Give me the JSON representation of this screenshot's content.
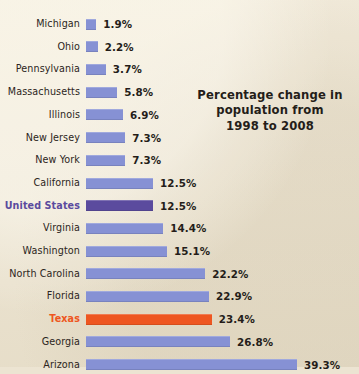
{
  "figure": {
    "background_color": "#ece4d2",
    "text_color": "#241d19",
    "title_lines": [
      "Percentage change in",
      "population from",
      "1998 to 2008"
    ]
  },
  "colors": {
    "bar_default": "#8691d4",
    "bar_united_states": "#5b4b9e",
    "bar_texas": "#ee5620",
    "label_united_states": "#5b4b9e",
    "label_texas": "#ee5620"
  },
  "chart_data": {
    "type": "bar",
    "orientation": "horizontal",
    "title": "Percentage change in population from 1998 to 2008",
    "xlabel": "",
    "ylabel": "",
    "xlim": [
      0,
      39.3
    ],
    "grid": false,
    "legend": null,
    "value_suffix": "%",
    "categories": [
      "Michigan",
      "Ohio",
      "Pennsylvania",
      "Massachusetts",
      "Illinois",
      "New Jersey",
      "New York",
      "California",
      "United States",
      "Virginia",
      "Washington",
      "North Carolina",
      "Florida",
      "Texas",
      "Georgia",
      "Arizona"
    ],
    "values": [
      1.9,
      2.2,
      3.7,
      5.8,
      6.9,
      7.3,
      7.3,
      12.5,
      12.5,
      14.4,
      15.1,
      22.2,
      22.9,
      23.4,
      26.8,
      39.3
    ],
    "value_labels": [
      "1.9%",
      "2.2%",
      "3.7%",
      "5.8%",
      "6.9%",
      "7.3%",
      "7.3%",
      "12.5%",
      "12.5%",
      "14.4%",
      "15.1%",
      "22.2%",
      "22.9%",
      "23.4%",
      "26.8%",
      "39.3%"
    ],
    "highlights": {
      "United States": "#5b4b9e",
      "Texas": "#ee5620"
    }
  },
  "rows": [
    {
      "label": "Michigan",
      "value": 1.9,
      "value_label": "1.9%",
      "style": "default"
    },
    {
      "label": "Ohio",
      "value": 2.2,
      "value_label": "2.2%",
      "style": "default"
    },
    {
      "label": "Pennsylvania",
      "value": 3.7,
      "value_label": "3.7%",
      "style": "default"
    },
    {
      "label": "Massachusetts",
      "value": 5.8,
      "value_label": "5.8%",
      "style": "default"
    },
    {
      "label": "Illinois",
      "value": 6.9,
      "value_label": "6.9%",
      "style": "default"
    },
    {
      "label": "New Jersey",
      "value": 7.3,
      "value_label": "7.3%",
      "style": "default"
    },
    {
      "label": "New York",
      "value": 7.3,
      "value_label": "7.3%",
      "style": "default"
    },
    {
      "label": "California",
      "value": 12.5,
      "value_label": "12.5%",
      "style": "default"
    },
    {
      "label": "United States",
      "value": 12.5,
      "value_label": "12.5%",
      "style": "us"
    },
    {
      "label": "Virginia",
      "value": 14.4,
      "value_label": "14.4%",
      "style": "default"
    },
    {
      "label": "Washington",
      "value": 15.1,
      "value_label": "15.1%",
      "style": "default"
    },
    {
      "label": "North Carolina",
      "value": 22.2,
      "value_label": "22.2%",
      "style": "default"
    },
    {
      "label": "Florida",
      "value": 22.9,
      "value_label": "22.9%",
      "style": "default"
    },
    {
      "label": "Texas",
      "value": 23.4,
      "value_label": "23.4%",
      "style": "accent"
    },
    {
      "label": "Georgia",
      "value": 26.8,
      "value_label": "26.8%",
      "style": "default"
    },
    {
      "label": "Arizona",
      "value": 39.3,
      "value_label": "39.3%",
      "style": "default"
    }
  ]
}
